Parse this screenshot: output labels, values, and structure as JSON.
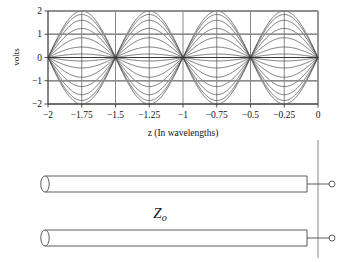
{
  "figure": {
    "title": "",
    "background_color": "#ffffff",
    "line_color": "#4a4a4a",
    "grid_color": "#555555",
    "frame_color": "#7a7a7a"
  },
  "chart_data": {
    "type": "line",
    "title": "",
    "xlabel": "z (In wavelengths)",
    "ylabel": "volts",
    "xlim": [
      -2,
      0
    ],
    "ylim": [
      -2,
      2
    ],
    "xticks": [
      -2,
      -1.75,
      -1.5,
      -1.25,
      -1,
      -0.75,
      -0.5,
      -0.25,
      0
    ],
    "xticklabels": [
      "-2",
      "-1.75",
      "-1.5",
      "-1.25",
      "-1",
      "-0.75",
      "-0.5",
      "-0.25",
      "0"
    ],
    "yticks": [
      -2,
      -1,
      0,
      1,
      2
    ],
    "yticklabels": [
      "-2",
      "-1",
      "0",
      "1",
      "2"
    ],
    "grid": true,
    "legend": "none",
    "node_positions": [
      -2.0,
      -1.5,
      -1.0,
      -0.5,
      0.0
    ],
    "antinode_positions": [
      -1.75,
      -1.25,
      -0.75,
      -0.25
    ],
    "wavelength": 1.0,
    "series": [
      {
        "name": "t1",
        "amplitude": 2.0,
        "phase_sign": 1
      },
      {
        "name": "t2",
        "amplitude": 1.85,
        "phase_sign": 1
      },
      {
        "name": "t3",
        "amplitude": 1.6,
        "phase_sign": 1
      },
      {
        "name": "t4",
        "amplitude": 1.25,
        "phase_sign": 1
      },
      {
        "name": "t5",
        "amplitude": 0.85,
        "phase_sign": 1
      },
      {
        "name": "t6",
        "amplitude": 0.45,
        "phase_sign": 1
      },
      {
        "name": "t7",
        "amplitude": 0.15,
        "phase_sign": 1
      },
      {
        "name": "t8",
        "amplitude": 0.15,
        "phase_sign": -1
      },
      {
        "name": "t9",
        "amplitude": 0.45,
        "phase_sign": -1
      },
      {
        "name": "t10",
        "amplitude": 0.85,
        "phase_sign": -1
      },
      {
        "name": "t11",
        "amplitude": 1.25,
        "phase_sign": -1
      },
      {
        "name": "t12",
        "amplitude": 1.6,
        "phase_sign": -1
      },
      {
        "name": "t13",
        "amplitude": 1.85,
        "phase_sign": -1
      },
      {
        "name": "t14",
        "amplitude": 2.0,
        "phase_sign": -1
      }
    ]
  },
  "diagram": {
    "impedance_label": "Z",
    "impedance_subscript": "o",
    "conductor_count": 2,
    "terminal_count": 2,
    "name": "transmission-line-diagram"
  }
}
